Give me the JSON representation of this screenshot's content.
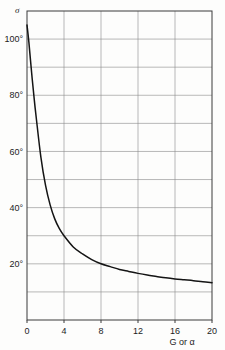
{
  "chart_data": {
    "type": "line",
    "title": "",
    "subtitle": "",
    "xlabel": "G or α",
    "ylabel": "σ",
    "xlim": [
      0,
      20
    ],
    "ylim": [
      0,
      110
    ],
    "grid": true,
    "legend": null,
    "x_ticks": [
      {
        "value": 0,
        "label": "0"
      },
      {
        "value": 4,
        "label": "4"
      },
      {
        "value": 8,
        "label": "8"
      },
      {
        "value": 12,
        "label": "12"
      },
      {
        "value": 16,
        "label": "16"
      },
      {
        "value": 20,
        "label": "20"
      }
    ],
    "y_ticks": [
      {
        "value": 20,
        "label": "20°"
      },
      {
        "value": 40,
        "label": "40°"
      },
      {
        "value": 60,
        "label": "60°"
      },
      {
        "value": 80,
        "label": "80°"
      },
      {
        "value": 100,
        "label": "100°"
      }
    ],
    "x_gridlines": [
      0,
      4,
      8,
      12,
      16,
      20
    ],
    "y_gridlines": [
      0,
      10,
      20,
      30,
      40,
      50,
      60,
      70,
      80,
      90,
      100,
      110
    ],
    "series": [
      {
        "name": "sigma-curve",
        "color": "#141414",
        "x": [
          0.0,
          0.2,
          0.5,
          0.8,
          1.0,
          1.5,
          2.0,
          2.5,
          3.0,
          3.5,
          4.0,
          5.0,
          6.0,
          7.0,
          8.0,
          9.0,
          10.0,
          11.0,
          12.0,
          13.0,
          14.0,
          15.0,
          16.0,
          17.0,
          18.0,
          19.0,
          20.0
        ],
        "y": [
          105.0,
          99.0,
          88.0,
          78.0,
          72.0,
          58.0,
          48.0,
          41.0,
          36.0,
          32.5,
          30.0,
          26.0,
          23.5,
          21.5,
          20.0,
          19.0,
          18.0,
          17.3,
          16.6,
          16.0,
          15.5,
          15.0,
          14.6,
          14.3,
          14.0,
          13.6,
          13.3
        ]
      }
    ],
    "annotations": []
  },
  "plot_geometry": {
    "left": 27,
    "right": 212,
    "top": 11,
    "bottom": 320
  },
  "colors": {
    "background": "#fdfdfc",
    "grid": "#8a8a8a",
    "frame": "#3a3a3a",
    "curve": "#141414",
    "text": "#1c1c1c"
  }
}
